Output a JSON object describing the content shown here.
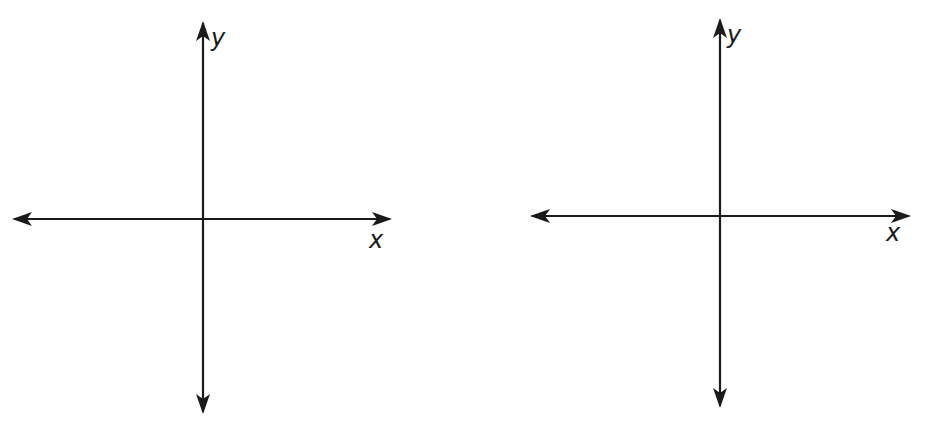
{
  "figure": {
    "background": "#ffffff",
    "stroke_color": "#1a1a1a",
    "graphs": [
      {
        "name": "left-coordinate-plane",
        "x_label": "x",
        "y_label": "y",
        "origin": [
          203,
          219
        ],
        "x_axis": {
          "x1": 14,
          "x2": 390
        },
        "y_axis": {
          "y1": 23,
          "y2": 412
        },
        "x_label_pos": [
          369,
          248
        ],
        "y_label_pos": [
          211,
          46
        ]
      },
      {
        "name": "right-coordinate-plane",
        "x_label": "x",
        "y_label": "y",
        "origin": [
          720,
          216
        ],
        "x_axis": {
          "x1": 532,
          "x2": 909
        },
        "y_axis": {
          "y1": 20,
          "y2": 406
        },
        "x_label_pos": [
          886,
          241
        ],
        "y_label_pos": [
          727,
          43
        ]
      }
    ]
  }
}
